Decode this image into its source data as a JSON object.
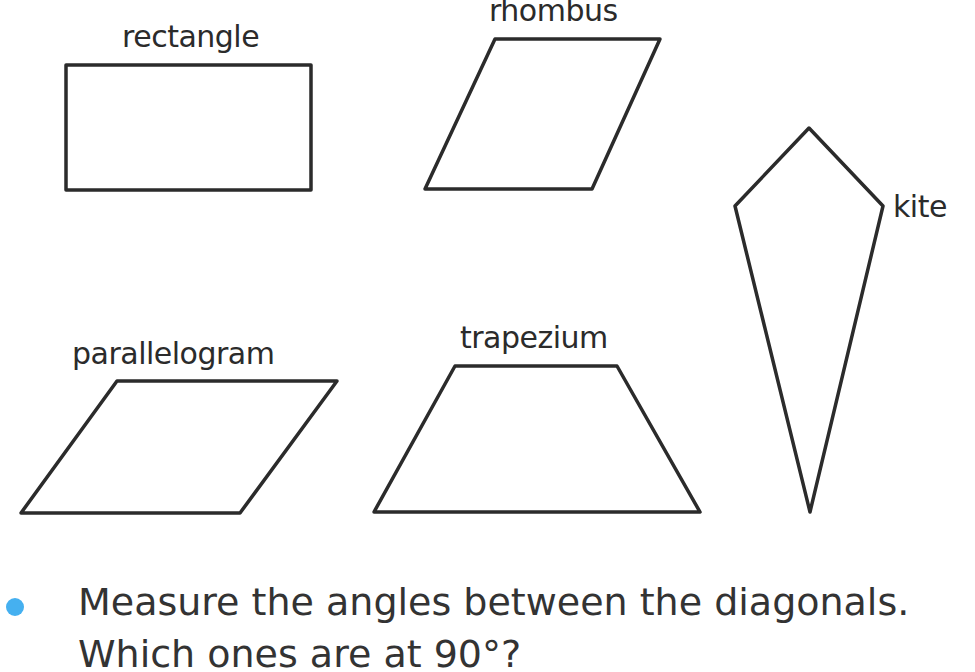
{
  "shapes": {
    "rectangle": {
      "label": "rectangle",
      "points": "66,65 311,65 311,190 66,190"
    },
    "rhombus": {
      "label": "rhombus",
      "points": "495,39 660,39 592,189 425,189"
    },
    "kite": {
      "label": "kite",
      "points": "809,128 883,206 810,512 735,206"
    },
    "parallelogram": {
      "label": "parallelogram",
      "points": "117,381 337,381 240,513 21,513"
    },
    "trapezium": {
      "label": "trapezium",
      "points": "455,366 617,366 700,512 374,512"
    }
  },
  "questions": [
    {
      "text": "Measure the angles between the diagonals.",
      "bullet": true
    },
    {
      "text": "Which ones are at 90°?",
      "bullet": false
    }
  ],
  "colors": {
    "stroke": "#2b2b2b",
    "bullet": "#45b0f0",
    "text": "#333333"
  }
}
